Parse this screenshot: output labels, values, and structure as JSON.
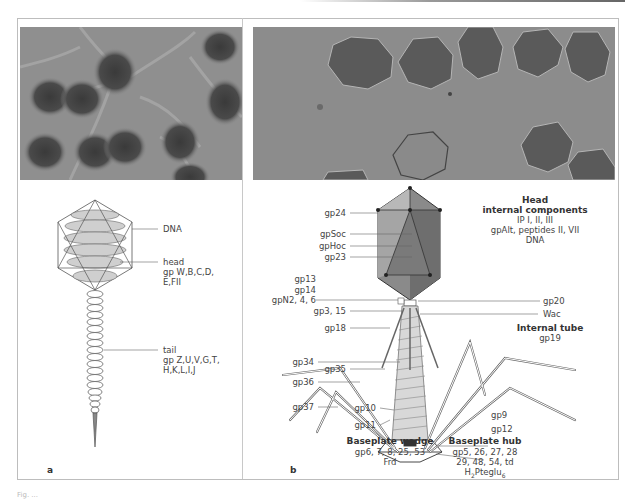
{
  "figure": {
    "caption_partial": "Fig. ...",
    "panels": [
      {
        "id": "a",
        "letter": "a",
        "photo": "electron-micrograph-of-phage-particles-with-flexible-tails",
        "labels": {
          "dna": "DNA",
          "head_title": "head",
          "head_line1": "gp W,B,C,D,",
          "head_line2": "E,FII",
          "tail_title": "tail",
          "tail_line1": "gp Z,U,V,G,T,",
          "tail_line2": "H,K,L,I,J"
        }
      },
      {
        "id": "b",
        "letter": "b",
        "photo": "cryo-electron-micrograph-of-phage-heads",
        "left_labels": [
          "gp24",
          "gpSoc",
          "gpHoc",
          "gp23",
          "gp13",
          "gp14",
          "gpN2, 4, 6",
          "gp3, 15",
          "gp18",
          "gp34",
          "gp35",
          "gp36",
          "gp37",
          "gp10",
          "gp11"
        ],
        "right_labels": [
          "gp20",
          "Wac",
          "gp9",
          "gp12"
        ],
        "head_internal": {
          "title1": "Head",
          "title2": "internal components",
          "line1": "IP I, II, III",
          "line2": "gpAlt, peptides II, VII",
          "line3": "DNA"
        },
        "internal_tube": {
          "title": "Internal tube",
          "line1": "gp19"
        },
        "baseplate_wedge": {
          "title": "Baseplate wedge",
          "line1": "gp6, 7, 8, 25, 53",
          "line2": "Frd"
        },
        "baseplate_hub": {
          "title": "Baseplate hub",
          "line1": "gp5, 26, 27, 28",
          "line2": "29, 48, 54, td",
          "line3_main": "H",
          "line3_sub1": "2",
          "line3_mid": "Pteglu",
          "line3_sub2": "6"
        }
      }
    ]
  }
}
